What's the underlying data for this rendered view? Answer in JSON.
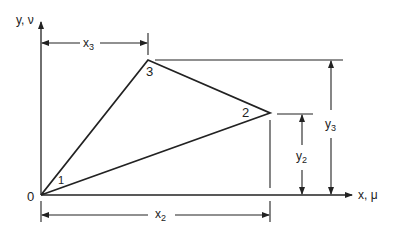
{
  "diagram": {
    "type": "triangle element geometry",
    "axes": {
      "x_label": "x, μ",
      "y_label": "y, ν"
    },
    "origin_label": "0",
    "nodes": [
      {
        "id": "1",
        "label": "1",
        "x": 0,
        "y": 0
      },
      {
        "id": "2",
        "label": "2",
        "x": "x2",
        "y": "y2"
      },
      {
        "id": "3",
        "label": "3",
        "x": "x3",
        "y": "y3"
      }
    ],
    "dimensions": {
      "x3": {
        "base": "x",
        "sub": "3"
      },
      "x2": {
        "base": "x",
        "sub": "2"
      },
      "y2": {
        "base": "y",
        "sub": "2"
      },
      "y3": {
        "base": "y",
        "sub": "3"
      }
    },
    "color": "#222222"
  }
}
